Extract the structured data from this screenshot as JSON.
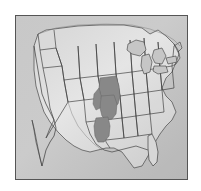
{
  "figure": {
    "type": "thumbnail-map",
    "alt_text": "Grayscale outline map of the contiguous United States with a shaded region highlighted in the central Great Plains"
  },
  "map": {
    "region": "Contiguous United States",
    "projection": "conic",
    "border_color": "#555555",
    "background_color": "#c9c9c9",
    "land_color": "#dcdcdc",
    "state_outline_color": "#3a3a3a",
    "highlight_color": "#8d8d8d",
    "highlight_outline_color": "#6a6a6a",
    "frame": {
      "left": 15,
      "top": 15,
      "width": 173,
      "height": 165
    }
  },
  "highlight": {
    "label": "Central Great Plains highlighted area",
    "states_covered": [
      "Nebraska",
      "Kansas",
      "Oklahoma"
    ],
    "color": "#8d8d8d"
  },
  "features": {
    "great_lakes_label": "Great Lakes",
    "gulf_label": "Gulf of Mexico",
    "pacific_label": "Pacific Coast",
    "atlantic_label": "Atlantic Coast",
    "florida_label": "Florida Peninsula",
    "baja_label": "Baja California"
  },
  "chart_data": {
    "type": "map",
    "highlighted_regions": [
      {
        "name": "Nebraska",
        "value": 1
      },
      {
        "name": "Kansas",
        "value": 1
      },
      {
        "name": "Oklahoma",
        "value": 1
      }
    ],
    "legend": [],
    "colors": {
      "highlight": "#8d8d8d",
      "base": "#dcdcdc",
      "outline": "#3a3a3a"
    }
  }
}
